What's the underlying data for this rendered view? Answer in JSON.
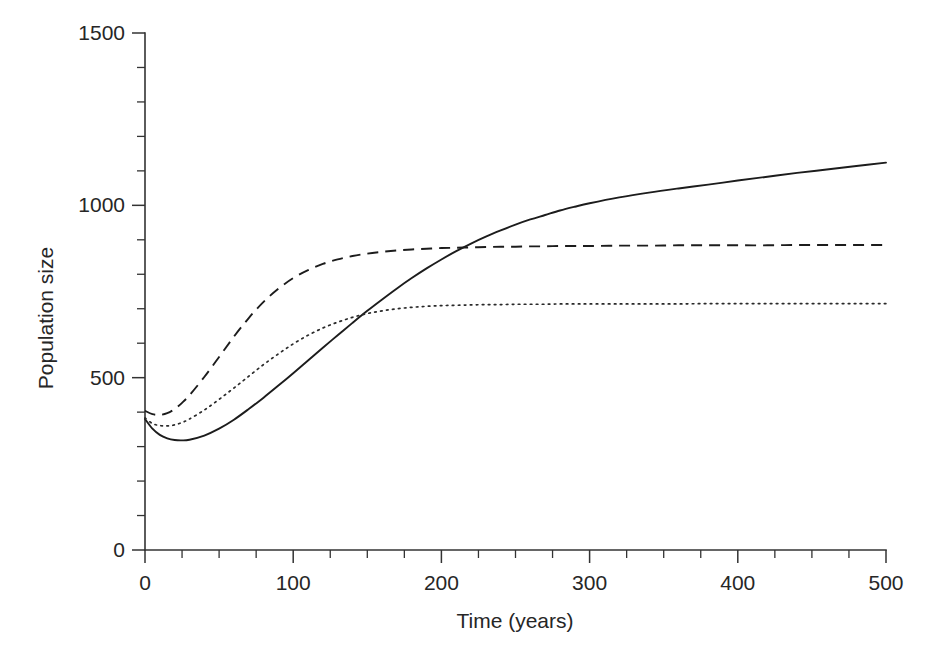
{
  "chart_data": {
    "type": "line",
    "title": "",
    "xlabel": "Time (years)",
    "ylabel": "Population size",
    "xlim": [
      0,
      500
    ],
    "ylim": [
      0,
      1500
    ],
    "grid": false,
    "legend": "none",
    "x_ticks": [
      0,
      100,
      200,
      300,
      400,
      500
    ],
    "x_tick_labels": [
      "0",
      "100",
      "200",
      "300",
      "400",
      "500"
    ],
    "x_minor_step": 25,
    "y_ticks": [
      0,
      500,
      1000,
      1500
    ],
    "y_tick_labels": [
      "0",
      "500",
      "1000",
      "1500"
    ],
    "y_minor_step": 100,
    "x": [
      0,
      5,
      10,
      15,
      20,
      25,
      30,
      40,
      50,
      60,
      70,
      80,
      90,
      100,
      110,
      120,
      130,
      140,
      150,
      160,
      170,
      180,
      190,
      200,
      210,
      220,
      230,
      240,
      250,
      260,
      270,
      280,
      290,
      300,
      320,
      340,
      360,
      380,
      400,
      420,
      440,
      460,
      480,
      500
    ],
    "series": [
      {
        "name": "solid-curve",
        "style": "solid",
        "color": "#1c1c1c",
        "plateau": 1125,
        "minimum": 318,
        "minimum_at": 25,
        "values": [
          380,
          352,
          334,
          324,
          319,
          318,
          320,
          332,
          352,
          378,
          409,
          442,
          477,
          513,
          550,
          587,
          623,
          659,
          694,
          727,
          759,
          789,
          817,
          843,
          867,
          889,
          909,
          927,
          944,
          959,
          972,
          985,
          996,
          1006,
          1023,
          1037,
          1049,
          1060,
          1072,
          1083,
          1094,
          1104,
          1114,
          1124
        ]
      },
      {
        "name": "dashed-curve",
        "style": "dashed",
        "color": "#1c1c1c",
        "plateau": 885,
        "minimum": 392,
        "minimum_at": 8,
        "values": [
          404,
          394,
          392,
          397,
          409,
          427,
          449,
          502,
          560,
          619,
          673,
          720,
          758,
          789,
          812,
          830,
          843,
          853,
          860,
          865,
          869,
          872,
          874,
          876,
          877,
          878,
          879,
          880,
          880,
          881,
          881,
          882,
          882,
          882,
          883,
          883,
          884,
          884,
          884,
          884,
          885,
          885,
          885,
          885
        ]
      },
      {
        "name": "dotted-curve",
        "style": "dotted",
        "color": "#2a2a2a",
        "plateau": 715,
        "minimum": 360,
        "minimum_at": 15,
        "values": [
          383,
          367,
          361,
          360,
          363,
          370,
          380,
          406,
          437,
          470,
          504,
          538,
          569,
          598,
          623,
          644,
          661,
          675,
          686,
          694,
          700,
          704,
          707,
          709,
          710,
          711,
          712,
          712,
          713,
          713,
          713,
          714,
          714,
          714,
          714,
          714,
          714,
          715,
          715,
          715,
          715,
          715,
          715,
          715
        ]
      }
    ]
  },
  "axes": {
    "x_title": "Time (years)",
    "y_title": "Population size"
  }
}
